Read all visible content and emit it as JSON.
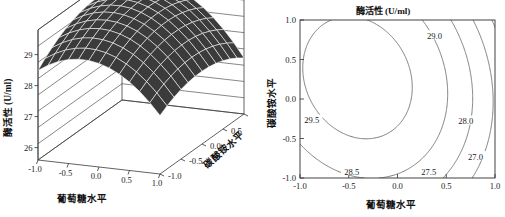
{
  "figure": {
    "width": 505,
    "height": 217,
    "background": "#ffffff",
    "panel_count": 2
  },
  "chart_data": [
    {
      "type": "surface",
      "panel": "left",
      "title": "",
      "xlabel": "葡萄糖水平",
      "ylabel": "碳酸铵水平",
      "zlabel": "酶活性 (U/ml)",
      "xticks": [
        "-1.0",
        "-0.5",
        "0.0",
        "0.5",
        "1.0"
      ],
      "xtick_values": [
        -1.0,
        -0.5,
        0.0,
        0.5,
        1.0
      ],
      "yticks": [
        "-1.0",
        "-0.5",
        "0.0",
        "0.5",
        "1.0"
      ],
      "ytick_values": [
        -1.0,
        -0.5,
        0.0,
        0.5,
        1.0
      ],
      "zticks": [
        "26",
        "27",
        "28",
        "29"
      ],
      "ztick_values": [
        26,
        27,
        28,
        29
      ],
      "xlim": [
        -1.0,
        1.0
      ],
      "ylim": [
        -1.0,
        1.0
      ],
      "zlim": [
        25.6,
        29.8
      ],
      "grid": true,
      "surface_color": "#3b3b3b",
      "mesh_color": "#ffffff",
      "grid_n": 12,
      "model": {
        "intercept": 29.62,
        "b_x": -0.72,
        "b_y": 0.18,
        "b_xx": -0.95,
        "b_yy": -0.5,
        "b_xy": -0.22
      },
      "description": "Response surface of enzyme activity versus glucose level and ammonium carbonate level; dome shaped surface peaking near x=-0.45, y=0.15"
    },
    {
      "type": "contour",
      "panel": "right",
      "title": "酶活性 (U/ml)",
      "xlabel": "葡萄糖水平",
      "ylabel": "碳酸铵水平",
      "xticks": [
        "-1.0",
        "-0.5",
        "0.0",
        "0.5",
        "1.0"
      ],
      "xtick_values": [
        -1.0,
        -0.5,
        0.0,
        0.5,
        1.0
      ],
      "yticks": [
        "-1.0",
        "-0.5",
        "0.0",
        "0.5",
        "1.0"
      ],
      "ytick_values": [
        -1.0,
        -0.5,
        0.0,
        0.5,
        1.0
      ],
      "xlim": [
        -1.0,
        1.0
      ],
      "ylim": [
        -1.0,
        1.0
      ],
      "grid": false,
      "legend": "none",
      "levels": [
        29.5,
        29.0,
        28.5,
        28.0,
        27.5,
        27.0
      ],
      "level_labels": [
        "29.5",
        "29.0",
        "28.5",
        "28.0",
        "27.5",
        "27.0"
      ],
      "line_color": "#6e6e6e",
      "model": {
        "intercept": 29.62,
        "b_x": -0.72,
        "b_y": 0.18,
        "b_xx": -0.95,
        "b_yy": -0.5,
        "b_xy": -0.22
      },
      "labels": [
        {
          "text": "29.5",
          "x": -0.88,
          "y": -0.27
        },
        {
          "text": "29.0",
          "x": 0.38,
          "y": 0.8
        },
        {
          "text": "28.5",
          "x": -0.47,
          "y": -0.92
        },
        {
          "text": "28.0",
          "x": 0.7,
          "y": -0.28
        },
        {
          "text": "27.5",
          "x": 0.32,
          "y": -0.93
        },
        {
          "text": "27.0",
          "x": 0.8,
          "y": -0.73
        }
      ],
      "description": "Contour plot of enzyme activity; innermost closed contour 29.5 near upper left region"
    }
  ],
  "text": {
    "chinese_enzyme_activity": "酶活性",
    "unit": "(U/ml)",
    "glucose_level": "葡萄糖水平",
    "ammonium_carbonate_level": "碳酸铵水平",
    "contour_title": "酶活性 (U/ml)",
    "surface_zlabel": "酶活性 (U/ml)"
  }
}
